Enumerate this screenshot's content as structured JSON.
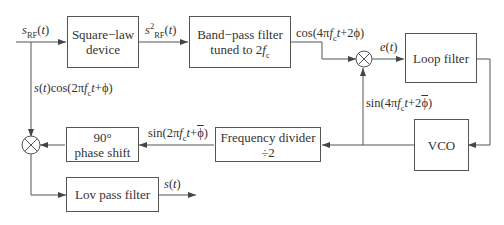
{
  "blocks": {
    "square_law": "Square−law device",
    "square_law_l1": "Square−law",
    "square_law_l2": "device",
    "bandpass_l1": "Band−pass filter",
    "bandpass_l2": "tuned to 2",
    "bandpass_fc": "f",
    "bandpass_fc_sub": "c",
    "loop_filter": "Loop filter",
    "vco": "VCO",
    "freq_div_l1": "Frequency divider",
    "freq_div_l2": "÷2",
    "phase_shift_l1": "90°",
    "phase_shift_l2": "phase shift",
    "lowpass": "Lov pass filter"
  },
  "signals": {
    "input": "sRF(t)",
    "squared": "s²RF(t)",
    "bpf_out": "cos(4πfct+2ϕ)",
    "error": "e(t)",
    "vco_feedback": "sin(4πfct+2ϕ̂)",
    "divider_out": "sin(2πfct+ϕ̂)",
    "branch": "s(t)cos(2πfct+ϕ)",
    "output": "s(t)"
  },
  "colors": {
    "line": "#555555",
    "text": "#333333",
    "background": "#ffffff"
  }
}
